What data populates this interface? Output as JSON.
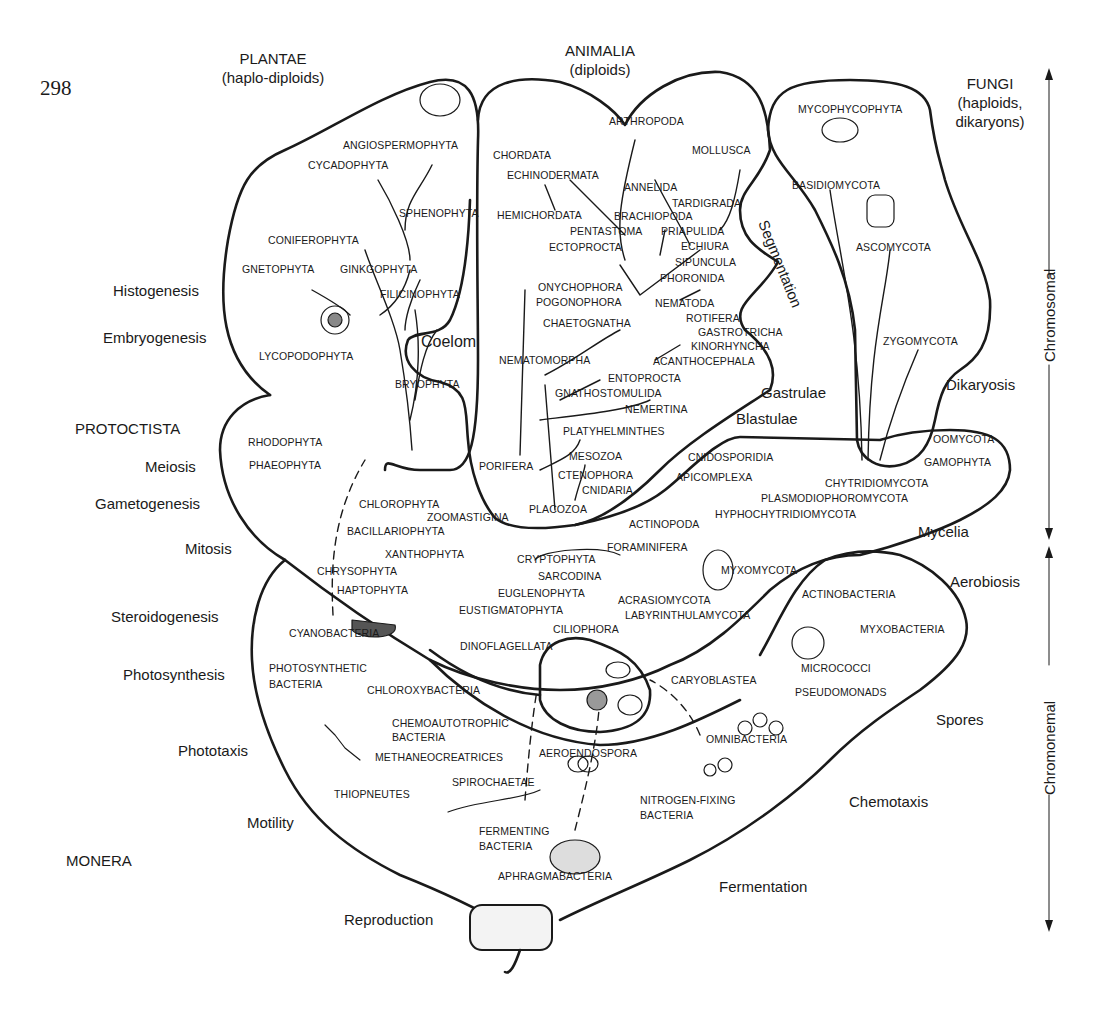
{
  "page_number": "298",
  "kingdoms": {
    "plantae": {
      "name": "PLANTAE",
      "note": "(haplo-diploids)"
    },
    "animalia": {
      "name": "ANIMALIA",
      "note": "(diploids)"
    },
    "fungi": {
      "name": "FUNGI",
      "note1": "(haploids,",
      "note2": "dikaryons)"
    },
    "protoctista": {
      "name": "PROTOCTISTA"
    },
    "monera": {
      "name": "MONERA"
    }
  },
  "processes_left": [
    "Histogenesis",
    "Embryogenesis",
    "Meiosis",
    "Gametogenesis",
    "Mitosis",
    "Steroidogenesis",
    "Photosynthesis",
    "Phototaxis",
    "Motility",
    "Reproduction"
  ],
  "processes_inner": {
    "coelom": "Coelom",
    "segmentation": "Segmentation",
    "gastrulae": "Gastrulae",
    "blastulae": "Blastulae",
    "dikaryosis": "Dikaryosis",
    "mycelia": "Mycelia",
    "aerobiosis": "Aerobiosis",
    "spores": "Spores",
    "chemotaxis": "Chemotaxis",
    "fermentation": "Fermentation"
  },
  "axis": {
    "chromosomal": "Chromosomal",
    "chromonemal": "Chromonemal"
  },
  "plantae_taxa": [
    "ANGIOSPERMOPHYTA",
    "CYCADOPHYTA",
    "SPHENOPHYTA",
    "CONIFEROPHYTA",
    "GNETOPHYTA",
    "GINKGOPHYTA",
    "FILICINOPHYTA",
    "LYCOPODOPHYTA",
    "BRYOPHYTA"
  ],
  "animalia_taxa": [
    "ARTHROPODA",
    "MOLLUSCA",
    "CHORDATA",
    "ECHINODERMATA",
    "ANNELIDA",
    "TARDIGRADA",
    "HEMICHORDATA",
    "BRACHIOPODA",
    "PRIAPULIDA",
    "PENTASTOMA",
    "ECHIURA",
    "ECTOPROCTA",
    "SIPUNCULA",
    "PHORONIDA",
    "ONYCHOPHORA",
    "POGONOPHORA",
    "NEMATODA",
    "ROTIFERA",
    "CHAETOGNATHA",
    "GASTROTRICHA",
    "KINORHYNCHA",
    "NEMATOMORPHA",
    "ACANTHOCEPHALA",
    "ENTOPROCTA",
    "GNATHOSTOMULIDA",
    "NEMERTINA",
    "PLATYHELMINTHES",
    "MESOZOA",
    "PORIFERA",
    "CTENOPHORA",
    "CNIDARIA",
    "PLACOZOA"
  ],
  "fungi_taxa": [
    "MYCOPHYCOPHYTA",
    "BASIDIOMYCOTA",
    "ASCOMYCOTA",
    "ZYGOMYCOTA"
  ],
  "protoctista_taxa": [
    "RHODOPHYTA",
    "PHAEOPHYTA",
    "CHLOROPHYTA",
    "ZOOMASTIGINA",
    "BACILLARIOPHYTA",
    "XANTHOPHYTA",
    "CHRYSOPHYTA",
    "HAPTOPHYTA",
    "CRYPTOPHYTA",
    "SARCODINA",
    "EUGLENOPHYTA",
    "EUSTIGMATOPHYTA",
    "DINOFLAGELLATA",
    "CILIOPHORA",
    "CNIDOSPORIDIA",
    "APICOMPLEXA",
    "ACTINOPODA",
    "FORAMINIFERA",
    "MYXOMYCOTA",
    "ACRASIOMYCOTA",
    "LABYRINTHULAMYCOTA",
    "CARYOBLASTEA",
    "OOMYCOTA",
    "GAMOPHYTA",
    "CHYTRIDIOMYCOTA",
    "PLASMODIOPHOROMYCOTA",
    "HYPHOCHYTRIDIOMYCOTA"
  ],
  "monera_taxa": [
    "CYANOBACTERIA",
    "PHOTOSYNTHETIC",
    "BACTERIA",
    "CHLOROXYBACTERIA",
    "CHEMOAUTOTROPHIC",
    "BACTERIA",
    "METHANEOCREATRICES",
    "AEROENDOSPORA",
    "SPIROCHAETAE",
    "THIOPNEUTES",
    "OMNIBACTERIA",
    "NITROGEN-FIXING",
    "BACTERIA",
    "FERMENTING",
    "BACTERIA",
    "APHRAGMABACTERIA",
    "ACTINOBACTERIA",
    "MYXOBACTERIA",
    "MICROCOCCI",
    "PSEUDOMONADS"
  ],
  "colors": {
    "ink": "#1a1a1a",
    "paper": "#ffffff"
  }
}
